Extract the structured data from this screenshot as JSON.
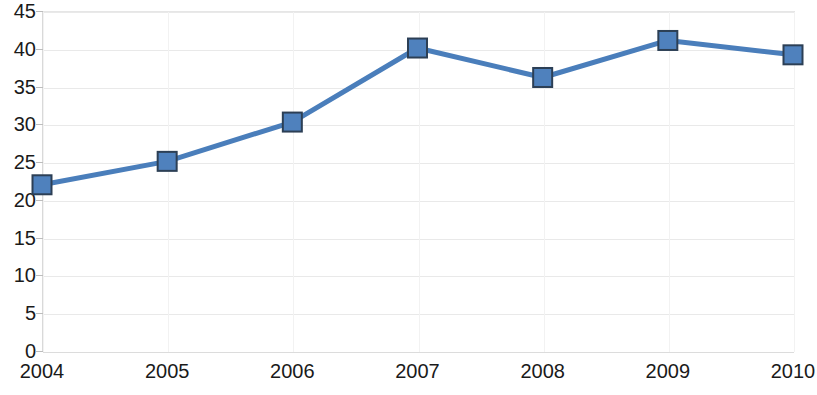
{
  "chart_data": {
    "type": "line",
    "title": "",
    "subtitle": "",
    "xlabel": "",
    "ylabel": "",
    "categories": [
      "2004",
      "2005",
      "2006",
      "2007",
      "2008",
      "2009",
      "2010"
    ],
    "values": [
      22.0,
      25.1,
      30.3,
      40.1,
      36.2,
      41.1,
      39.2
    ],
    "series": [
      {
        "name": "",
        "values": [
          22.0,
          25.1,
          30.3,
          40.1,
          36.2,
          41.1,
          39.2
        ]
      }
    ],
    "ylim": [
      0,
      45
    ],
    "yticks": [
      0,
      5,
      10,
      15,
      20,
      25,
      30,
      35,
      40,
      45
    ],
    "ytick_labels": [
      "0",
      "5",
      "10",
      "15",
      "20",
      "25",
      "30",
      "35",
      "40",
      "45"
    ],
    "xtick_labels": [
      "2004",
      "2005",
      "2006",
      "2007",
      "2008",
      "2009",
      "2010"
    ],
    "grid": true,
    "grid_axis": "y",
    "legend": false,
    "legend_position": "none",
    "marker": "square",
    "line_color": "#4a7ebb",
    "marker_fill_color": "#4f81bd",
    "marker_edge_color": "#2c3f55",
    "grid_color": "#e9e9e9",
    "background_color": "#ffffff",
    "annotations": []
  }
}
